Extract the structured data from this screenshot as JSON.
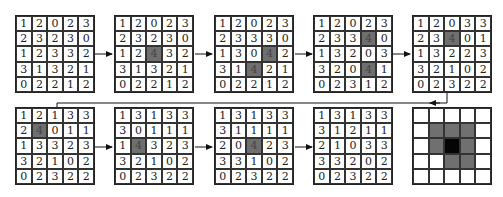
{
  "diagram": {
    "grids": [
      {
        "values": [
          [
            1,
            2,
            0,
            2,
            3
          ],
          [
            2,
            3,
            2,
            3,
            0
          ],
          [
            1,
            2,
            3,
            3,
            2
          ],
          [
            3,
            1,
            3,
            2,
            1
          ],
          [
            0,
            2,
            2,
            1,
            2
          ]
        ],
        "highlight": []
      },
      {
        "values": [
          [
            1,
            2,
            0,
            2,
            3
          ],
          [
            2,
            3,
            2,
            3,
            0
          ],
          [
            1,
            2,
            4,
            3,
            2
          ],
          [
            3,
            1,
            3,
            2,
            1
          ],
          [
            0,
            2,
            2,
            1,
            2
          ]
        ],
        "highlight": [
          [
            2,
            2
          ]
        ]
      },
      {
        "values": [
          [
            1,
            2,
            0,
            2,
            3
          ],
          [
            2,
            3,
            3,
            3,
            0
          ],
          [
            1,
            3,
            0,
            4,
            2
          ],
          [
            3,
            1,
            4,
            2,
            1
          ],
          [
            0,
            2,
            2,
            1,
            2
          ]
        ],
        "highlight": [
          [
            2,
            3
          ],
          [
            3,
            2
          ]
        ]
      },
      {
        "values": [
          [
            1,
            2,
            0,
            2,
            3
          ],
          [
            2,
            3,
            3,
            4,
            0
          ],
          [
            1,
            3,
            2,
            0,
            3
          ],
          [
            3,
            2,
            0,
            4,
            1
          ],
          [
            0,
            2,
            3,
            1,
            2
          ]
        ],
        "highlight": [
          [
            1,
            3
          ],
          [
            3,
            3
          ]
        ]
      },
      {
        "values": [
          [
            1,
            2,
            0,
            3,
            3
          ],
          [
            2,
            3,
            4,
            0,
            1
          ],
          [
            1,
            3,
            2,
            2,
            3
          ],
          [
            3,
            2,
            1,
            0,
            2
          ],
          [
            0,
            2,
            3,
            2,
            2
          ]
        ],
        "highlight": [
          [
            1,
            2
          ]
        ]
      },
      {
        "values": [
          [
            1,
            2,
            1,
            3,
            3
          ],
          [
            2,
            4,
            0,
            1,
            1
          ],
          [
            1,
            3,
            3,
            2,
            3
          ],
          [
            3,
            2,
            1,
            0,
            2
          ],
          [
            0,
            2,
            3,
            2,
            2
          ]
        ],
        "highlight": [
          [
            1,
            1
          ]
        ]
      },
      {
        "values": [
          [
            1,
            3,
            1,
            3,
            3
          ],
          [
            3,
            0,
            1,
            1,
            1
          ],
          [
            1,
            4,
            3,
            2,
            3
          ],
          [
            3,
            2,
            1,
            0,
            2
          ],
          [
            0,
            2,
            3,
            2,
            2
          ]
        ],
        "highlight": [
          [
            2,
            1
          ]
        ]
      },
      {
        "values": [
          [
            1,
            3,
            1,
            3,
            3
          ],
          [
            3,
            1,
            1,
            1,
            1
          ],
          [
            2,
            0,
            4,
            2,
            3
          ],
          [
            3,
            3,
            1,
            0,
            2
          ],
          [
            0,
            2,
            3,
            2,
            2
          ]
        ],
        "highlight": [
          [
            2,
            2
          ]
        ]
      },
      {
        "values": [
          [
            1,
            3,
            1,
            3,
            3
          ],
          [
            3,
            1,
            2,
            1,
            1
          ],
          [
            2,
            1,
            0,
            3,
            3
          ],
          [
            3,
            3,
            2,
            0,
            2
          ],
          [
            0,
            2,
            3,
            2,
            2
          ]
        ],
        "highlight": []
      }
    ],
    "final_pattern": {
      "shading": [
        [
          "w",
          "w",
          "w",
          "w",
          "w"
        ],
        [
          "w",
          "g",
          "g",
          "g",
          "w"
        ],
        [
          "w",
          "g",
          "b",
          "g",
          "w"
        ],
        [
          "w",
          "w",
          "g",
          "g",
          "w"
        ],
        [
          "w",
          "w",
          "w",
          "w",
          "w"
        ]
      ],
      "colors": {
        "w": "#ffffff",
        "g": "#707070",
        "b": "#050505"
      }
    },
    "highlight_color": "#6f6f6f"
  }
}
